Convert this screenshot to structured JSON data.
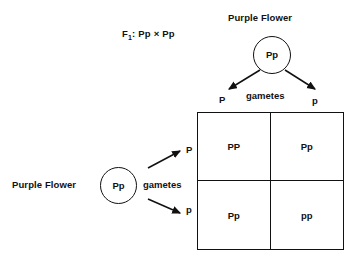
{
  "diagram": {
    "cross_note": {
      "generation": "F",
      "generation_sub": "1",
      "expression": ": Pp × Pp"
    },
    "top_parent": {
      "title": "Purple Flower",
      "genotype": "Pp",
      "gametes_label": "gametes",
      "gamete_left": "P",
      "gamete_right": "p"
    },
    "left_parent": {
      "title": "Purple Flower",
      "genotype": "Pp",
      "gametes_label": "gametes",
      "gamete_top": "P",
      "gamete_bottom": "p"
    },
    "punnett_square": {
      "column_alleles": [
        "P",
        "p"
      ],
      "row_alleles": [
        "P",
        "p"
      ],
      "cells": [
        {
          "row": 0,
          "col": 0,
          "genotype": "PP"
        },
        {
          "row": 0,
          "col": 1,
          "genotype": "Pp"
        },
        {
          "row": 1,
          "col": 0,
          "genotype": "Pp"
        },
        {
          "row": 1,
          "col": 1,
          "genotype": "pp"
        }
      ]
    },
    "colors": {
      "background": "#ffffff",
      "ink": "#111111"
    }
  }
}
